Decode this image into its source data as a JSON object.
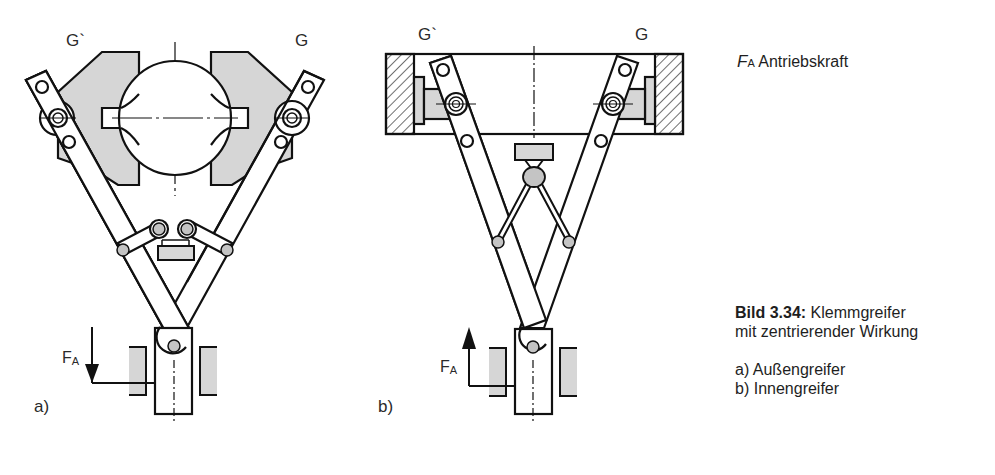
{
  "figure": {
    "number_label": "Bild 3.34:",
    "title_line1": "Klemmgreifer",
    "title_line2": "mit zentrierender Wirkung",
    "items": [
      {
        "key": "a)",
        "text": "Außengreifer"
      },
      {
        "key": "b)",
        "text": "Innengreifer"
      }
    ]
  },
  "legend": {
    "symbol": "F",
    "symbol_sub": "A",
    "text": "Antriebskraft"
  },
  "diagram_a": {
    "label": "a)",
    "jaw_left_label": "G`",
    "jaw_right_label": "G",
    "force_label": "F",
    "force_sub": "A",
    "force_direction": "down"
  },
  "diagram_b": {
    "label": "b)",
    "jaw_left_label": "G`",
    "jaw_right_label": "G",
    "force_label": "F",
    "force_sub": "A",
    "force_direction": "up"
  },
  "colors": {
    "line": "#111111",
    "fill_gray": "#d6d6d6",
    "background": "#ffffff"
  }
}
